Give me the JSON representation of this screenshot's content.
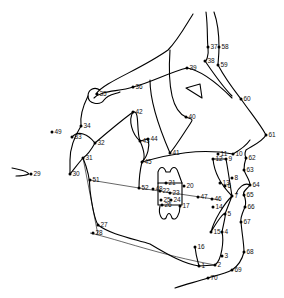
{
  "diagram": {
    "colors": {
      "line": "#000000",
      "background": "#ffffff"
    },
    "landmarks": [
      {
        "id": "1",
        "x": 199,
        "y": 266
      },
      {
        "id": "2",
        "x": 215,
        "y": 265
      },
      {
        "id": "3",
        "x": 222,
        "y": 256
      },
      {
        "id": "4",
        "x": 222,
        "y": 232
      },
      {
        "id": "5",
        "x": 225,
        "y": 214
      },
      {
        "id": "6",
        "x": 225,
        "y": 186
      },
      {
        "id": "7",
        "x": 232,
        "y": 196
      },
      {
        "id": "8",
        "x": 232,
        "y": 178
      },
      {
        "id": "9",
        "x": 226,
        "y": 159
      },
      {
        "id": "10",
        "x": 233,
        "y": 154
      },
      {
        "id": "11",
        "x": 218,
        "y": 154
      },
      {
        "id": "12",
        "x": 213,
        "y": 159
      },
      {
        "id": "13",
        "x": 220,
        "y": 183
      },
      {
        "id": "14",
        "x": 213,
        "y": 207
      },
      {
        "id": "15",
        "x": 211,
        "y": 232
      },
      {
        "id": "16",
        "x": 195,
        "y": 247
      },
      {
        "id": "17",
        "x": 180,
        "y": 206
      },
      {
        "id": "20",
        "x": 184,
        "y": 186
      },
      {
        "id": "21",
        "x": 166,
        "y": 183
      },
      {
        "id": "22",
        "x": 160,
        "y": 191
      },
      {
        "id": "23",
        "x": 170,
        "y": 193
      },
      {
        "id": "24",
        "x": 171,
        "y": 200
      },
      {
        "id": "25",
        "x": 161,
        "y": 200
      },
      {
        "id": "26",
        "x": 162,
        "y": 205
      },
      {
        "id": "27",
        "x": 98,
        "y": 225
      },
      {
        "id": "28",
        "x": 93,
        "y": 233
      },
      {
        "id": "29",
        "x": 31,
        "y": 174
      },
      {
        "id": "30",
        "x": 70,
        "y": 174
      },
      {
        "id": "31",
        "x": 83,
        "y": 158
      },
      {
        "id": "32",
        "x": 95,
        "y": 143
      },
      {
        "id": "33",
        "x": 72,
        "y": 137
      },
      {
        "id": "34",
        "x": 81,
        "y": 126
      },
      {
        "id": "35",
        "x": 97,
        "y": 94
      },
      {
        "id": "36",
        "x": 133,
        "y": 87
      },
      {
        "id": "37",
        "x": 208,
        "y": 47
      },
      {
        "id": "38",
        "x": 205,
        "y": 61
      },
      {
        "id": "39",
        "x": 187,
        "y": 68
      },
      {
        "id": "40",
        "x": 186,
        "y": 117
      },
      {
        "id": "41",
        "x": 170,
        "y": 153
      },
      {
        "id": "42",
        "x": 133,
        "y": 112
      },
      {
        "id": "43",
        "x": 140,
        "y": 141
      },
      {
        "id": "44",
        "x": 148,
        "y": 139
      },
      {
        "id": "45",
        "x": 142,
        "y": 162
      },
      {
        "id": "46",
        "x": 212,
        "y": 199
      },
      {
        "id": "47",
        "x": 198,
        "y": 197
      },
      {
        "id": "48",
        "x": 153,
        "y": 189
      },
      {
        "id": "49",
        "x": 52,
        "y": 132
      },
      {
        "id": "51",
        "x": 90,
        "y": 180
      },
      {
        "id": "52",
        "x": 139,
        "y": 188
      },
      {
        "id": "58",
        "x": 219,
        "y": 47
      },
      {
        "id": "59",
        "x": 218,
        "y": 65
      },
      {
        "id": "60",
        "x": 241,
        "y": 99
      },
      {
        "id": "61",
        "x": 266,
        "y": 135
      },
      {
        "id": "62",
        "x": 246,
        "y": 158
      },
      {
        "id": "63",
        "x": 244,
        "y": 170
      },
      {
        "id": "64",
        "x": 250,
        "y": 185
      },
      {
        "id": "65",
        "x": 244,
        "y": 195
      },
      {
        "id": "66",
        "x": 245,
        "y": 207
      },
      {
        "id": "67",
        "x": 241,
        "y": 222
      },
      {
        "id": "68",
        "x": 244,
        "y": 252
      },
      {
        "id": "69",
        "x": 232,
        "y": 270
      },
      {
        "id": "70",
        "x": 208,
        "y": 278
      }
    ]
  }
}
